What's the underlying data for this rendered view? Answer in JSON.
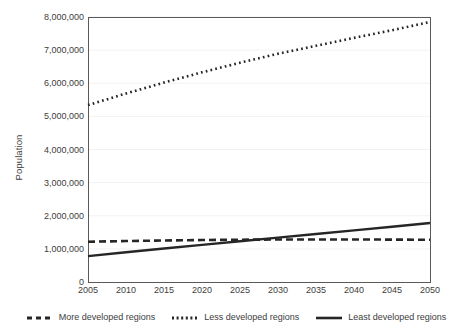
{
  "chart_data": {
    "type": "line",
    "title": "",
    "xlabel": "",
    "ylabel": "Population",
    "xlim": [
      2005,
      2050
    ],
    "ylim": [
      0,
      8000000
    ],
    "grid": true,
    "legend_position": "bottom",
    "x": [
      2005,
      2010,
      2015,
      2020,
      2025,
      2030,
      2035,
      2040,
      2045,
      2050
    ],
    "xticklabels": [
      "2005",
      "2010",
      "2015",
      "2020",
      "2025",
      "2030",
      "2035",
      "2040",
      "2045",
      "2050"
    ],
    "yticks": [
      0,
      1000000,
      2000000,
      3000000,
      4000000,
      5000000,
      6000000,
      7000000,
      8000000
    ],
    "yticklabels": [
      "0",
      "1,000,000",
      "2,000,000",
      "3,000,000",
      "4,000,000",
      "5,000,000",
      "6,000,000",
      "7,000,000",
      "8,000,000"
    ],
    "series": [
      {
        "name": "More developed regions",
        "style": "dashed",
        "color": "#262626",
        "values": [
          1215000,
          1236000,
          1253000,
          1267000,
          1277000,
          1282000,
          1284000,
          1283000,
          1280000,
          1275000
        ]
      },
      {
        "name": "Less developed regions",
        "style": "dotted",
        "color": "#262626",
        "values": [
          5340000,
          5690000,
          6020000,
          6330000,
          6620000,
          6890000,
          7130000,
          7370000,
          7600000,
          7850000
        ]
      },
      {
        "name": "Least developed regions",
        "style": "solid",
        "color": "#262626",
        "values": [
          780000,
          900000,
          1010000,
          1120000,
          1230000,
          1340000,
          1450000,
          1560000,
          1670000,
          1780000
        ]
      }
    ]
  },
  "legend": {
    "items": [
      {
        "label": "More developed regions",
        "style": "dashed"
      },
      {
        "label": "Less developed regions",
        "style": "dotted"
      },
      {
        "label": "Least developed regions",
        "style": "solid"
      }
    ]
  },
  "axes": {
    "y_title": "Population"
  },
  "colors": {
    "line": "#262626",
    "frame": "#595959",
    "grid": "#f2f2f2",
    "text": "#3d3d3d",
    "background": "#ffffff"
  }
}
